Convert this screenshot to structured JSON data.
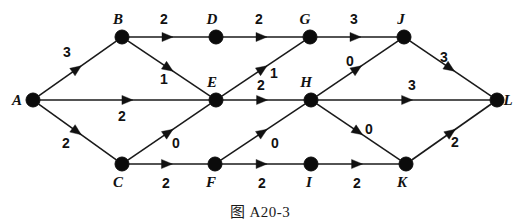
{
  "figure": {
    "caption": "图 A20-3",
    "colors": {
      "node": "#0b0b0b",
      "edge": "#1a1a1a",
      "label": "#111111",
      "background": "#ffffff"
    }
  },
  "chart_data": {
    "type": "diagram",
    "title": "图 A20-3",
    "subtype": "weighted-directed-graph",
    "node_radius": 7,
    "nodes": [
      {
        "id": "A",
        "label": "A",
        "x": 33,
        "y": 100,
        "label_dx": -16,
        "label_dy": 5
      },
      {
        "id": "B",
        "label": "B",
        "x": 122,
        "y": 37,
        "label_dx": -4,
        "label_dy": -13
      },
      {
        "id": "C",
        "label": "C",
        "x": 122,
        "y": 164,
        "label_dx": -4,
        "label_dy": 23
      },
      {
        "id": "D",
        "label": "D",
        "x": 216,
        "y": 37,
        "label_dx": -4,
        "label_dy": -13
      },
      {
        "id": "E",
        "label": "E",
        "x": 216,
        "y": 100,
        "label_dx": -4,
        "label_dy": -13
      },
      {
        "id": "F",
        "label": "F",
        "x": 215,
        "y": 164,
        "label_dx": -4,
        "label_dy": 23
      },
      {
        "id": "G",
        "label": "G",
        "x": 310,
        "y": 37,
        "label_dx": -5,
        "label_dy": -13
      },
      {
        "id": "H",
        "label": "H",
        "x": 311,
        "y": 100,
        "label_dx": -5,
        "label_dy": -13
      },
      {
        "id": "I",
        "label": "I",
        "x": 311,
        "y": 164,
        "label_dx": -2,
        "label_dy": 23
      },
      {
        "id": "J",
        "label": "J",
        "x": 404,
        "y": 37,
        "label_dx": -3,
        "label_dy": -13
      },
      {
        "id": "K",
        "label": "K",
        "x": 406,
        "y": 164,
        "label_dx": -4,
        "label_dy": 23
      },
      {
        "id": "L",
        "label": "L",
        "x": 497,
        "y": 100,
        "label_dx": 11,
        "label_dy": 5
      }
    ],
    "edges": [
      {
        "from": "A",
        "to": "B",
        "weight": "3",
        "wx": 67,
        "wy": 57
      },
      {
        "from": "A",
        "to": "E",
        "weight": "2",
        "wx": 122,
        "wy": 121
      },
      {
        "from": "A",
        "to": "C",
        "weight": "2",
        "wx": 66,
        "wy": 148
      },
      {
        "from": "B",
        "to": "D",
        "weight": "2",
        "wx": 164,
        "wy": 24
      },
      {
        "from": "B",
        "to": "E",
        "weight": "1",
        "wx": 164,
        "wy": 84
      },
      {
        "from": "D",
        "to": "G",
        "weight": "2",
        "wx": 259,
        "wy": 24
      },
      {
        "from": "C",
        "to": "E",
        "weight": "0",
        "wx": 176,
        "wy": 148
      },
      {
        "from": "C",
        "to": "F",
        "weight": "2",
        "wx": 166,
        "wy": 188
      },
      {
        "from": "E",
        "to": "G",
        "weight": "1",
        "wx": 274,
        "wy": 78
      },
      {
        "from": "E",
        "to": "H",
        "weight": "2",
        "wx": 261,
        "wy": 90
      },
      {
        "from": "F",
        "to": "H",
        "weight": "0",
        "wx": 275,
        "wy": 148
      },
      {
        "from": "F",
        "to": "I",
        "weight": "2",
        "wx": 262,
        "wy": 188
      },
      {
        "from": "G",
        "to": "J",
        "weight": "3",
        "wx": 354,
        "wy": 24
      },
      {
        "from": "H",
        "to": "J",
        "weight": "0",
        "wx": 350,
        "wy": 66
      },
      {
        "from": "H",
        "to": "L",
        "weight": "3",
        "wx": 412,
        "wy": 90
      },
      {
        "from": "H",
        "to": "K",
        "weight": "0",
        "wx": 369,
        "wy": 134
      },
      {
        "from": "I",
        "to": "K",
        "weight": "2",
        "wx": 357,
        "wy": 188
      },
      {
        "from": "J",
        "to": "L",
        "weight": "3",
        "wx": 444,
        "wy": 62
      },
      {
        "from": "K",
        "to": "L",
        "weight": "2",
        "wx": 455,
        "wy": 147
      }
    ]
  }
}
